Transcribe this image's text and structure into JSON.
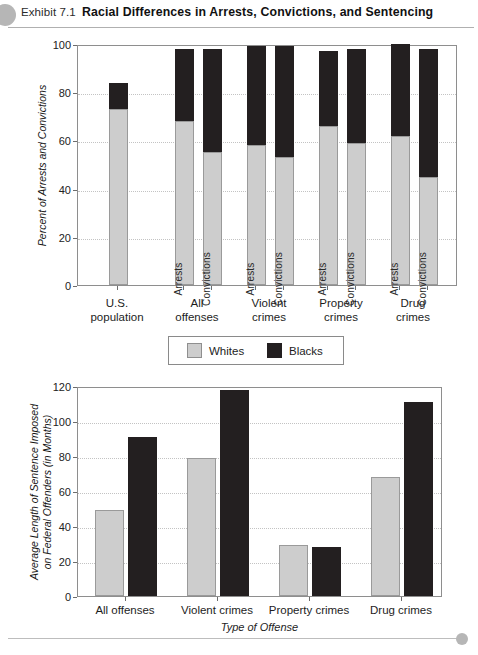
{
  "header": {
    "exhibit_label": "Exhibit 7.1",
    "title": "Racial Differences in Arrests, Convictions, and Sentencing",
    "dot_color": "#b6b6b6"
  },
  "legend": {
    "items": [
      {
        "label": "Whites",
        "color": "#cdcdcd"
      },
      {
        "label": "Blacks",
        "color": "#231f20"
      }
    ]
  },
  "chart_data": [
    {
      "type": "bar",
      "id": "arrests-convictions-chart",
      "title": "",
      "stacked": true,
      "xlabel": "",
      "ylabel": "Percent of Arrests and Convictions",
      "ylim": [
        0,
        100
      ],
      "yticks": [
        0,
        20,
        40,
        60,
        80,
        100
      ],
      "grid": true,
      "legend_position": "below",
      "categories": [
        "U.S. population",
        "All offenses",
        "Violent crimes",
        "Property crimes",
        "Drug crimes"
      ],
      "groups": [
        {
          "category": "U.S. population",
          "category_line1": "U.S.",
          "category_line2": "population",
          "bars": [
            {
              "label": "",
              "whites": 73,
              "blacks": 11,
              "total": 84
            }
          ]
        },
        {
          "category": "All offenses",
          "category_line1": "All",
          "category_line2": "offenses",
          "bars": [
            {
              "label": "Arrests",
              "whites": 68,
              "blacks": 30,
              "total": 98
            },
            {
              "label": "Convictions",
              "whites": 55,
              "blacks": 43,
              "total": 98
            }
          ]
        },
        {
          "category": "Violent crimes",
          "category_line1": "Violent",
          "category_line2": "crimes",
          "bars": [
            {
              "label": "Arrests",
              "whites": 58,
              "blacks": 41,
              "total": 99
            },
            {
              "label": "Convictions",
              "whites": 53,
              "blacks": 46,
              "total": 99
            }
          ]
        },
        {
          "category": "Property crimes",
          "category_line1": "Property",
          "category_line2": "crimes",
          "bars": [
            {
              "label": "Arrests",
              "whites": 66,
              "blacks": 31,
              "total": 97
            },
            {
              "label": "Convictions",
              "whites": 59,
              "blacks": 39,
              "total": 98
            }
          ]
        },
        {
          "category": "Drug crimes",
          "category_line1": "Drug",
          "category_line2": "crimes",
          "bars": [
            {
              "label": "Arrests",
              "whites": 62,
              "blacks": 38,
              "total": 100
            },
            {
              "label": "Convictions",
              "whites": 45,
              "blacks": 53,
              "total": 98
            }
          ]
        }
      ]
    },
    {
      "type": "bar",
      "id": "sentence-length-chart",
      "title": "",
      "stacked": false,
      "xlabel": "Type of Offense",
      "ylabel": "Average Length of Sentence Imposed on Federal Offenders (in Months)",
      "ylabel_line1": "Average Length of Sentence Imposed",
      "ylabel_line2": "on Federal Offenders (in Months)",
      "ylim": [
        0,
        120
      ],
      "yticks": [
        0,
        20,
        40,
        60,
        80,
        100,
        120
      ],
      "grid": true,
      "categories": [
        "All offenses",
        "Violent crimes",
        "Property crimes",
        "Drug crimes"
      ],
      "series": [
        {
          "name": "Whites",
          "color": "#cdcdcd",
          "values": [
            49,
            79,
            29,
            68
          ]
        },
        {
          "name": "Blacks",
          "color": "#231f20",
          "values": [
            91,
            118,
            28,
            111
          ]
        }
      ]
    }
  ]
}
